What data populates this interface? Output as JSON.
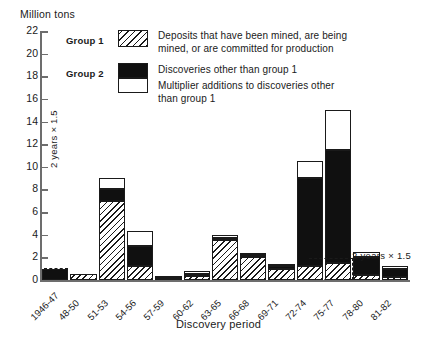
{
  "chart_data": {
    "type": "bar",
    "title": "",
    "ylabel": "Million tons",
    "xlabel": "Discovery period",
    "ylim": [
      0,
      22
    ],
    "ytick_step": 2,
    "yticks": [
      0,
      2,
      4,
      6,
      8,
      10,
      12,
      14,
      16,
      18,
      20,
      22
    ],
    "grid": false,
    "stacked": true,
    "legend_position": "top-center",
    "categories": [
      "1946-47",
      "48-50",
      "51-53",
      "54-56",
      "57-59",
      "60-62",
      "63-65",
      "66-68",
      "69-71",
      "72-74",
      "75-77",
      "78-80",
      "81-82"
    ],
    "series": [
      {
        "name": "Group 1",
        "label": "Deposits that have been mined, are being mined, or are committed for production",
        "fill": "diagonal-hatch",
        "values": [
          0.0,
          0.5,
          7.0,
          1.2,
          0.15,
          0.35,
          3.5,
          2.0,
          1.0,
          1.2,
          1.5,
          0.4,
          0.3
        ]
      },
      {
        "name": "Group 2 discoveries",
        "label": "Discoveries other than group 1",
        "fill": "solid-black",
        "values": [
          1.0,
          0.0,
          1.0,
          1.8,
          0.05,
          0.2,
          0.2,
          0.2,
          0.25,
          7.8,
          10.0,
          1.6,
          0.7
        ]
      },
      {
        "name": "Multiplier additions",
        "label": "Multiplier additions to discoveries other than group 1",
        "fill": "white",
        "values": [
          0.0,
          0.0,
          1.0,
          1.3,
          0.1,
          0.25,
          0.3,
          0.15,
          0.2,
          1.5,
          3.5,
          0.5,
          0.2
        ]
      }
    ],
    "annotations": [
      {
        "text": "2 years  ×  1.5",
        "position": "left-inside-vertical"
      },
      {
        "text": "2 years  ×  1.5",
        "position": "right-outside"
      }
    ]
  },
  "legend": {
    "group1_tag": "Group 1",
    "group2_tag": "Group 2",
    "entry1": "Deposits that have been mined, are being\nmined, or are committed for production",
    "entry2": "Discoveries other than group 1",
    "entry3": "Multiplier additions to discoveries other\nthan group 1"
  },
  "axes": {
    "y_unit_label": "Million tons",
    "x_title": "Discovery period"
  }
}
